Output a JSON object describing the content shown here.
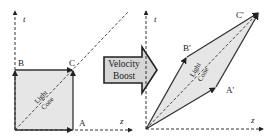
{
  "left_panel": {
    "axes": {
      "t_label": "t",
      "z_label": "z"
    },
    "points": {
      "A": "A",
      "B": "B",
      "C": "C"
    },
    "light_cone_line1": "Light",
    "light_cone_line2": "Cone"
  },
  "arrow": {
    "line1": "Velocity",
    "line2": "Boost"
  },
  "right_panel": {
    "axes": {
      "t_label": "t",
      "z_label": "z"
    },
    "points": {
      "A": "A'",
      "B": "B'",
      "C": "C'"
    },
    "light_cone_line1": "Light",
    "light_cone_line2": "Cone"
  },
  "colors": {
    "fill": "#e6e6e6",
    "stroke": "#333333",
    "arrow_fill": "#d6d6d6",
    "arrow_stroke": "#222222"
  }
}
